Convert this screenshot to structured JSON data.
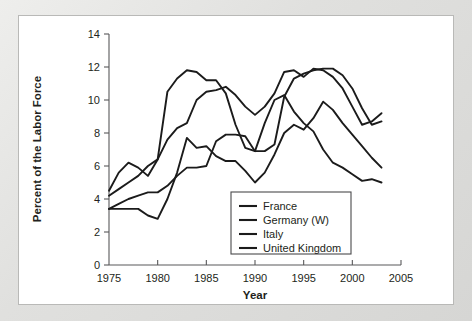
{
  "chart_data": {
    "type": "line",
    "title": "",
    "xlabel": "Year",
    "ylabel": "Percent of the Labor Force",
    "xlim": [
      1975,
      2005
    ],
    "ylim": [
      0,
      14
    ],
    "xticks": [
      "1975",
      "1980",
      "1985",
      "1990",
      "1995",
      "2000",
      "2005"
    ],
    "yticks": [
      "0",
      "2",
      "4",
      "6",
      "8",
      "10",
      "12",
      "14"
    ],
    "xtick_values": [
      1975,
      1980,
      1985,
      1990,
      1995,
      2000,
      2005
    ],
    "ytick_values": [
      0,
      2,
      4,
      6,
      8,
      10,
      12,
      14
    ],
    "grid": false,
    "legend_position": "lower center",
    "line_color": "#1b1b1b",
    "series": [
      {
        "name": "France",
        "x": [
          1975,
          1976,
          1977,
          1978,
          1979,
          1980,
          1981,
          1982,
          1983,
          1984,
          1985,
          1986,
          1987,
          1988,
          1989,
          1990,
          1991,
          1992,
          1993,
          1994,
          1995,
          1996,
          1997,
          1998,
          1999,
          2000,
          2001,
          2002,
          2003
        ],
        "values": [
          4.2,
          4.6,
          5.0,
          5.4,
          6.0,
          6.4,
          7.6,
          8.3,
          8.6,
          10.0,
          10.5,
          10.6,
          10.8,
          10.3,
          9.6,
          9.1,
          9.6,
          10.4,
          11.7,
          11.8,
          11.4,
          11.9,
          11.8,
          11.4,
          10.7,
          9.6,
          8.5,
          8.7,
          9.2
        ]
      },
      {
        "name": "Germany (W)",
        "x": [
          1975,
          1976,
          1977,
          1978,
          1979,
          1980,
          1981,
          1982,
          1983,
          1984,
          1985,
          1986,
          1987,
          1988,
          1989,
          1990,
          1991,
          1992,
          1993,
          1994,
          1995,
          1996,
          1997,
          1998,
          1999,
          2000,
          2001,
          2002,
          2003
        ],
        "values": [
          3.4,
          3.4,
          3.4,
          3.4,
          3.0,
          2.8,
          4.0,
          5.6,
          7.7,
          7.1,
          7.2,
          6.6,
          6.3,
          6.3,
          5.7,
          5.0,
          5.6,
          6.7,
          8.0,
          8.5,
          8.2,
          8.9,
          9.9,
          9.4,
          8.6,
          7.9,
          7.2,
          6.5,
          5.9
        ]
      },
      {
        "name": "Italy",
        "x": [
          1975,
          1976,
          1977,
          1978,
          1979,
          1980,
          1981,
          1982,
          1983,
          1984,
          1985,
          1986,
          1987,
          1988,
          1989,
          1990,
          1991,
          1992,
          1993,
          1994,
          1995,
          1996,
          1997,
          1998,
          1999,
          2000,
          2001,
          2002,
          2003
        ],
        "values": [
          3.4,
          3.7,
          4.0,
          4.2,
          4.4,
          4.4,
          4.8,
          5.4,
          5.9,
          5.9,
          6.0,
          7.5,
          7.9,
          7.9,
          7.8,
          6.9,
          6.9,
          7.3,
          10.2,
          11.3,
          11.6,
          11.8,
          11.9,
          11.9,
          11.5,
          10.7,
          9.5,
          8.5,
          8.7
        ]
      },
      {
        "name": "United Kingdom",
        "x": [
          1975,
          1976,
          1977,
          1978,
          1979,
          1980,
          1981,
          1982,
          1983,
          1984,
          1985,
          1986,
          1987,
          1988,
          1989,
          1990,
          1991,
          1992,
          1993,
          1994,
          1995,
          1996,
          1997,
          1998,
          1999,
          2000,
          2001,
          2002,
          2003
        ],
        "values": [
          4.5,
          5.6,
          6.2,
          5.9,
          5.4,
          6.4,
          10.5,
          11.3,
          11.8,
          11.7,
          11.2,
          11.2,
          10.4,
          8.5,
          7.1,
          6.9,
          8.6,
          10.0,
          10.3,
          9.3,
          8.6,
          8.1,
          7.0,
          6.2,
          5.9,
          5.5,
          5.1,
          5.2,
          5.0
        ]
      }
    ]
  },
  "legend": {
    "entries": [
      {
        "label": "France"
      },
      {
        "label": "Germany (W)"
      },
      {
        "label": "Italy"
      },
      {
        "label": "United Kingdom"
      }
    ]
  }
}
